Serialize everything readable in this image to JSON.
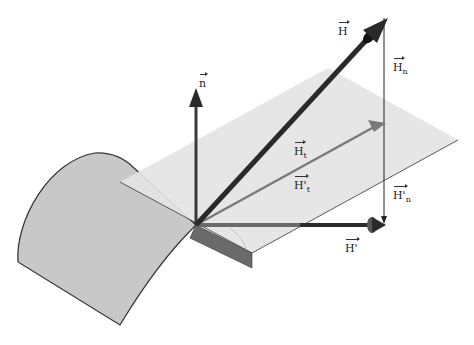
{
  "diagram": {
    "labels": {
      "n": {
        "base": "n",
        "sub": ""
      },
      "H": {
        "base": "H",
        "sub": ""
      },
      "Hn": {
        "base": "H",
        "sub": "n"
      },
      "Ht": {
        "base": "H",
        "sub": "t"
      },
      "Hpt": {
        "base": "H'",
        "sub": "t"
      },
      "Hpn": {
        "base": "H'",
        "sub": "n"
      },
      "Hp": {
        "base": "H'",
        "sub": ""
      }
    },
    "colors": {
      "surface": "#c8c8c8",
      "plane": "#e4e4e4",
      "vector_dark": "#2a2a2a",
      "vector_gray": "#7a7a7a",
      "edge": "#333333"
    }
  }
}
